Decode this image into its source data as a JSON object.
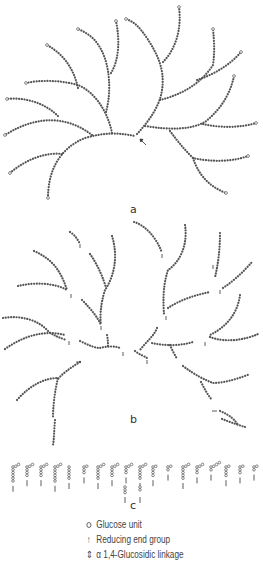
{
  "figure": {
    "panels": [
      {
        "id": "a",
        "label": "a",
        "description": "Intact branched polysaccharide molecule with one reducing end group"
      },
      {
        "id": "b",
        "label": "b",
        "description": "Partially cleaved molecule: fragments, each with a reducing end group"
      },
      {
        "id": "c",
        "label": "c",
        "description": "Small oligosaccharide fragments (limit dextrins and linear oligomers)"
      }
    ],
    "legend": {
      "items": [
        {
          "symbol": "circle-icon",
          "label": "Glucose unit"
        },
        {
          "symbol": "arrow-up-icon",
          "label": "Reducing end group"
        },
        {
          "symbol": "linkage-icon",
          "label": "α 1,4-Glucosidic linkage"
        }
      ]
    },
    "colors": {
      "background": "#ffffff",
      "chain": "#555555",
      "text": "#444444"
    }
  }
}
